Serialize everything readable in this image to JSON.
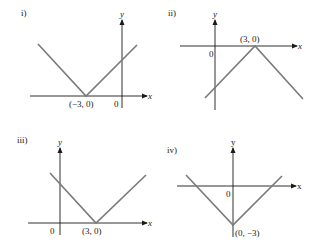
{
  "panels": [
    {
      "label": "i)",
      "x_axis_label": "x",
      "y_axis_label": "y",
      "origin_label": "0",
      "vertex_label": "(−3, 0)",
      "vertex": [
        -3,
        0
      ],
      "shape": "V opening upward",
      "equation_hint": "y = |x + 3|"
    },
    {
      "label": "ii)",
      "x_axis_label": "x",
      "y_axis_label": "y",
      "origin_label": "0",
      "vertex_label": "(3, 0)",
      "vertex": [
        3,
        0
      ],
      "shape": "inverted V opening downward",
      "equation_hint": "y = −|x − 3|"
    },
    {
      "label": "iii)",
      "x_axis_label": "x",
      "y_axis_label": "y",
      "origin_label": "0",
      "vertex_label": "(3, 0)",
      "vertex": [
        3,
        0
      ],
      "shape": "V opening upward",
      "equation_hint": "y = |x − 3|"
    },
    {
      "label": "iv)",
      "x_axis_label": "x",
      "y_axis_label": "y",
      "origin_label": "0",
      "vertex_label": "(0, −3)",
      "vertex": [
        0,
        -3
      ],
      "shape": "V opening upward",
      "equation_hint": "y = |x| − 3"
    }
  ],
  "colors": {
    "axis": "#1a1a1a",
    "curve": "#7a7a7a",
    "background": "#ffffff"
  }
}
